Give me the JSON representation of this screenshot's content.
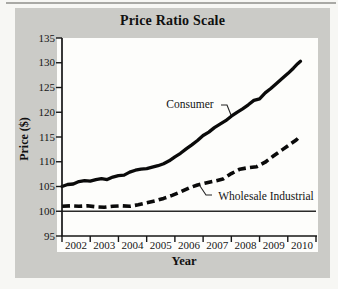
{
  "page": {
    "top_rule_color": "#a9a9a5",
    "panel_bg": "#cbcbc7",
    "plot_bg": "#fdfdfb",
    "line_color": "#0a0a0a",
    "axis_color": "#161616",
    "reference_line_color": "#2a2a2a",
    "leader_color": "#222222"
  },
  "chart_data": {
    "type": "line",
    "title": "Price Ratio Scale",
    "xlabel": "Year",
    "ylabel": "Price ($)",
    "xlim": [
      2001.5,
      2010.5
    ],
    "ylim": [
      95,
      135
    ],
    "x_tick_labels": [
      2002,
      2003,
      2004,
      2005,
      2006,
      2007,
      2008,
      2009,
      2010
    ],
    "y_tick_labels": [
      95,
      100,
      105,
      110,
      115,
      120,
      125,
      130,
      135
    ],
    "grid": false,
    "reference_line_y": 100,
    "legend_position": "inline-annotations",
    "series": [
      {
        "name": "Consumer",
        "style": "solid",
        "points": [
          [
            2001.5,
            105.0
          ],
          [
            2001.7,
            105.4
          ],
          [
            2001.9,
            105.5
          ],
          [
            2002.1,
            106.0
          ],
          [
            2002.3,
            106.2
          ],
          [
            2002.5,
            106.1
          ],
          [
            2002.7,
            106.4
          ],
          [
            2002.9,
            106.6
          ],
          [
            2003.1,
            106.4
          ],
          [
            2003.3,
            106.9
          ],
          [
            2003.5,
            107.2
          ],
          [
            2003.7,
            107.3
          ],
          [
            2003.9,
            107.9
          ],
          [
            2004.1,
            108.3
          ],
          [
            2004.3,
            108.5
          ],
          [
            2004.5,
            108.6
          ],
          [
            2004.7,
            108.9
          ],
          [
            2004.9,
            109.2
          ],
          [
            2005.1,
            109.6
          ],
          [
            2005.3,
            110.2
          ],
          [
            2005.5,
            111.0
          ],
          [
            2005.7,
            111.7
          ],
          [
            2005.9,
            112.6
          ],
          [
            2006.1,
            113.4
          ],
          [
            2006.3,
            114.3
          ],
          [
            2006.5,
            115.3
          ],
          [
            2006.7,
            116.0
          ],
          [
            2006.9,
            116.9
          ],
          [
            2007.1,
            117.6
          ],
          [
            2007.3,
            118.3
          ],
          [
            2007.5,
            119.2
          ],
          [
            2007.7,
            120.0
          ],
          [
            2007.9,
            120.7
          ],
          [
            2008.1,
            121.5
          ],
          [
            2008.3,
            122.4
          ],
          [
            2008.5,
            122.7
          ],
          [
            2008.7,
            123.9
          ],
          [
            2008.9,
            124.8
          ],
          [
            2009.1,
            125.8
          ],
          [
            2009.3,
            126.8
          ],
          [
            2009.5,
            127.8
          ],
          [
            2009.7,
            128.9
          ],
          [
            2009.85,
            129.8
          ],
          [
            2009.95,
            130.3
          ]
        ]
      },
      {
        "name": "Wholesale Industrial",
        "style": "dashed",
        "points": [
          [
            2001.5,
            101.0
          ],
          [
            2001.8,
            101.1
          ],
          [
            2002.1,
            101.0
          ],
          [
            2002.4,
            101.1
          ],
          [
            2002.7,
            100.9
          ],
          [
            2003.0,
            100.8
          ],
          [
            2003.3,
            101.0
          ],
          [
            2003.6,
            101.1
          ],
          [
            2003.9,
            101.0
          ],
          [
            2004.2,
            101.3
          ],
          [
            2004.5,
            101.7
          ],
          [
            2004.8,
            102.1
          ],
          [
            2005.1,
            102.6
          ],
          [
            2005.4,
            103.2
          ],
          [
            2005.7,
            103.9
          ],
          [
            2006.0,
            104.7
          ],
          [
            2006.3,
            105.3
          ],
          [
            2006.6,
            105.7
          ],
          [
            2006.9,
            106.1
          ],
          [
            2007.2,
            106.5
          ],
          [
            2007.5,
            107.6
          ],
          [
            2007.8,
            108.5
          ],
          [
            2008.1,
            108.8
          ],
          [
            2008.4,
            109.0
          ],
          [
            2008.7,
            109.9
          ],
          [
            2009.0,
            111.2
          ],
          [
            2009.3,
            112.4
          ],
          [
            2009.6,
            113.6
          ],
          [
            2009.8,
            114.4
          ],
          [
            2009.95,
            115.2
          ]
        ]
      }
    ],
    "annotations": [
      {
        "text": "Consumer",
        "x": 190,
        "y": 104,
        "leader": [
          [
            221,
            105
          ],
          [
            227,
            105
          ],
          [
            231,
            115
          ]
        ]
      },
      {
        "text": "Wholesale Industrial",
        "x": 266,
        "y": 196,
        "leader": [
          [
            212,
            195
          ],
          [
            206,
            195
          ],
          [
            200,
            186
          ]
        ]
      }
    ]
  }
}
